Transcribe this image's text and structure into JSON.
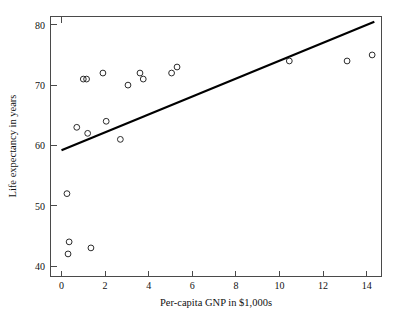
{
  "chart_data": {
    "type": "scatter",
    "title": "",
    "xlabel": "Per-capita GNP in $1,000s",
    "ylabel": "Life expectancy in years",
    "xlim": [
      -0.5,
      14.7
    ],
    "ylim": [
      38.5,
      81.5
    ],
    "xticks": [
      0,
      2,
      4,
      6,
      8,
      10,
      12,
      14
    ],
    "yticks": [
      40,
      50,
      60,
      70,
      80
    ],
    "xticklabels": [
      "0",
      "2",
      "4",
      "6",
      "8",
      "10",
      "12",
      "14"
    ],
    "yticklabels": [
      "40",
      "50",
      "60",
      "70",
      "80"
    ],
    "grid": false,
    "legend": false,
    "marker": "open-circle",
    "marker_color": "#2b2b2b",
    "points": [
      {
        "x": 0.25,
        "y": 52
      },
      {
        "x": 0.35,
        "y": 44
      },
      {
        "x": 0.3,
        "y": 42
      },
      {
        "x": 0.7,
        "y": 63
      },
      {
        "x": 1.0,
        "y": 71
      },
      {
        "x": 1.15,
        "y": 71
      },
      {
        "x": 1.2,
        "y": 62
      },
      {
        "x": 1.35,
        "y": 43
      },
      {
        "x": 1.9,
        "y": 72
      },
      {
        "x": 2.05,
        "y": 64
      },
      {
        "x": 2.7,
        "y": 61
      },
      {
        "x": 3.05,
        "y": 70
      },
      {
        "x": 3.6,
        "y": 72
      },
      {
        "x": 3.75,
        "y": 71
      },
      {
        "x": 5.05,
        "y": 72
      },
      {
        "x": 5.3,
        "y": 73
      },
      {
        "x": 10.45,
        "y": 74
      },
      {
        "x": 13.1,
        "y": 74
      },
      {
        "x": 14.25,
        "y": 75
      }
    ],
    "fit_line": {
      "label": "regression line",
      "color": "#000000",
      "x_start": 0.0,
      "y_start": 59.2,
      "x_end": 14.35,
      "y_end": 80.5,
      "slope": 1.484,
      "intercept": 59.2
    }
  }
}
